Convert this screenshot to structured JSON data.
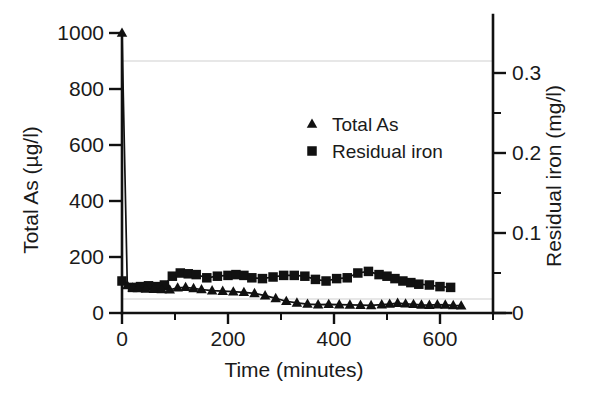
{
  "chart_data": {
    "type": "line",
    "title": "",
    "xlabel": "Time (minutes)",
    "ylabel": "Total As (µg/l)",
    "y2label": "Residual iron (mg/l)",
    "xlim": [
      0,
      700
    ],
    "ylim": [
      0,
      1000
    ],
    "y2lim": [
      0,
      0.35
    ],
    "xticks": [
      0,
      200,
      400,
      600
    ],
    "xtick_labels": [
      "0",
      "200",
      "400",
      "600"
    ],
    "xminor_ticks": [
      100,
      300,
      500,
      700
    ],
    "yticks": [
      0,
      200,
      400,
      600,
      800,
      1000
    ],
    "ytick_labels": [
      "0",
      "200",
      "400",
      "600",
      "800",
      "1000"
    ],
    "y2ticks": [
      0,
      0.1,
      0.2,
      0.3
    ],
    "y2tick_labels": [
      "0",
      "0.1",
      "0.2",
      "0.3"
    ],
    "y2minor_ticks": [
      0.05,
      0.15,
      0.25
    ],
    "grid": "horizontal-faint",
    "gridlines_y": [
      900,
      50
    ],
    "legend_position": "upper-center",
    "marker_color": "#111111",
    "line_color": "#111111",
    "grid_color": "#cfcfcf",
    "series": [
      {
        "name": "Total As",
        "axis": "left",
        "marker": "triangle",
        "x": [
          0,
          10,
          20,
          30,
          45,
          60,
          75,
          90,
          105,
          120,
          135,
          150,
          170,
          190,
          210,
          230,
          250,
          270,
          290,
          310,
          330,
          350,
          370,
          390,
          410,
          430,
          450,
          470,
          490,
          505,
          520,
          535,
          550,
          565,
          580,
          595,
          610,
          625,
          640
        ],
        "y": [
          1000,
          98,
          90,
          88,
          86,
          85,
          84,
          83,
          90,
          92,
          88,
          84,
          80,
          78,
          76,
          74,
          70,
          62,
          52,
          42,
          36,
          32,
          30,
          31,
          30,
          29,
          28,
          27,
          30,
          32,
          35,
          33,
          31,
          29,
          28,
          30,
          29,
          27,
          26
        ]
      },
      {
        "name": "Residual iron",
        "axis": "right",
        "marker": "square",
        "x": [
          0,
          20,
          35,
          50,
          65,
          80,
          95,
          110,
          125,
          140,
          160,
          180,
          200,
          215,
          230,
          245,
          265,
          285,
          305,
          325,
          345,
          365,
          385,
          405,
          425,
          445,
          465,
          485,
          500,
          515,
          530,
          545,
          560,
          580,
          600,
          620
        ],
        "y": [
          0.04,
          0.032,
          0.033,
          0.034,
          0.033,
          0.035,
          0.046,
          0.05,
          0.049,
          0.048,
          0.044,
          0.046,
          0.047,
          0.048,
          0.047,
          0.044,
          0.043,
          0.045,
          0.047,
          0.047,
          0.046,
          0.042,
          0.04,
          0.043,
          0.044,
          0.05,
          0.052,
          0.048,
          0.046,
          0.043,
          0.04,
          0.038,
          0.036,
          0.035,
          0.033,
          0.032
        ]
      }
    ],
    "legend": [
      {
        "label": "Total As",
        "marker": "triangle"
      },
      {
        "label": "Residual iron",
        "marker": "square"
      }
    ]
  }
}
